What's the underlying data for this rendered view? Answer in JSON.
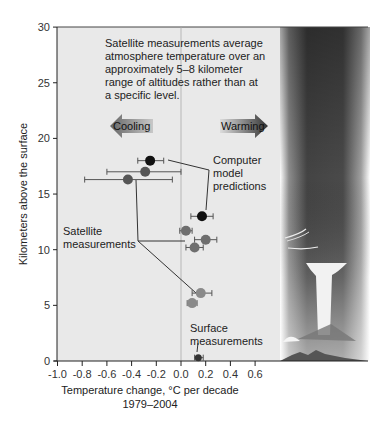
{
  "chart_data": {
    "type": "scatter",
    "title": "",
    "xlabel": "Temperature change, °C per decade",
    "xlabel_sub": "1979–2004",
    "ylabel": "Kilometers above the surface",
    "xlim": [
      -1.0,
      0.7
    ],
    "ylim": [
      0,
      30
    ],
    "xticks": [
      "-1.0",
      "-0.8",
      "-0.6",
      "-0.4",
      "-0.2",
      "0.0",
      "0.2",
      "0.4",
      "0.6"
    ],
    "xtick_values": [
      -1.0,
      -0.8,
      -0.6,
      -0.4,
      -0.2,
      0.0,
      0.2,
      0.4,
      0.6
    ],
    "yticks": [
      "0",
      "5",
      "10",
      "15",
      "20",
      "25",
      "30"
    ],
    "ytick_values": [
      0,
      5,
      10,
      15,
      20,
      25,
      30
    ],
    "grid": false,
    "zero_line": true,
    "annotation_note": [
      "Satellite measurements average",
      "atmosphere temperature over an",
      "approximately 5–8 kilometer",
      "range of altitudes rather than at",
      "a specific level."
    ],
    "arrows": {
      "cooling": "Cooling",
      "warming": "Warming"
    },
    "labels": {
      "model": [
        "Computer",
        "model",
        "predictions"
      ],
      "satellite": [
        "Satellite",
        "measurements"
      ],
      "surface": [
        "Surface",
        "measurements"
      ]
    },
    "series": [
      {
        "name": "Computer model predictions",
        "color": "#111111",
        "points": [
          {
            "x": -0.25,
            "y": 18.0,
            "xerr": [
              -0.35,
              -0.14
            ]
          },
          {
            "x": 0.17,
            "y": 13.0,
            "xerr": [
              0.08,
              0.26
            ]
          }
        ]
      },
      {
        "name": "Satellite measurements (lower stratosphere/upper troposphere)",
        "color": "#555555",
        "points": [
          {
            "x": -0.29,
            "y": 17.0,
            "xerr": [
              -0.6,
              0.0
            ]
          },
          {
            "x": -0.43,
            "y": 16.3,
            "xerr": [
              -0.78,
              -0.07
            ]
          }
        ]
      },
      {
        "name": "Satellite measurements (mid troposphere)",
        "color": "#6e6e6e",
        "points": [
          {
            "x": 0.04,
            "y": 11.7,
            "xerr": [
              -0.01,
              0.09
            ]
          },
          {
            "x": 0.2,
            "y": 10.9,
            "xerr": [
              0.11,
              0.29
            ]
          },
          {
            "x": 0.11,
            "y": 10.2,
            "xerr": [
              0.04,
              0.18
            ]
          }
        ]
      },
      {
        "name": "Satellite measurements (lower troposphere)",
        "color": "#8a8a8a",
        "points": [
          {
            "x": 0.16,
            "y": 6.1,
            "xerr": [
              0.09,
              0.25
            ]
          },
          {
            "x": 0.09,
            "y": 5.2,
            "xerr": [
              0.05,
              0.13
            ]
          }
        ]
      },
      {
        "name": "Surface measurements",
        "color": "#333333",
        "points": [
          {
            "x": 0.14,
            "y": 0.3,
            "xerr": [
              0.11,
              0.18
            ]
          }
        ]
      }
    ]
  }
}
